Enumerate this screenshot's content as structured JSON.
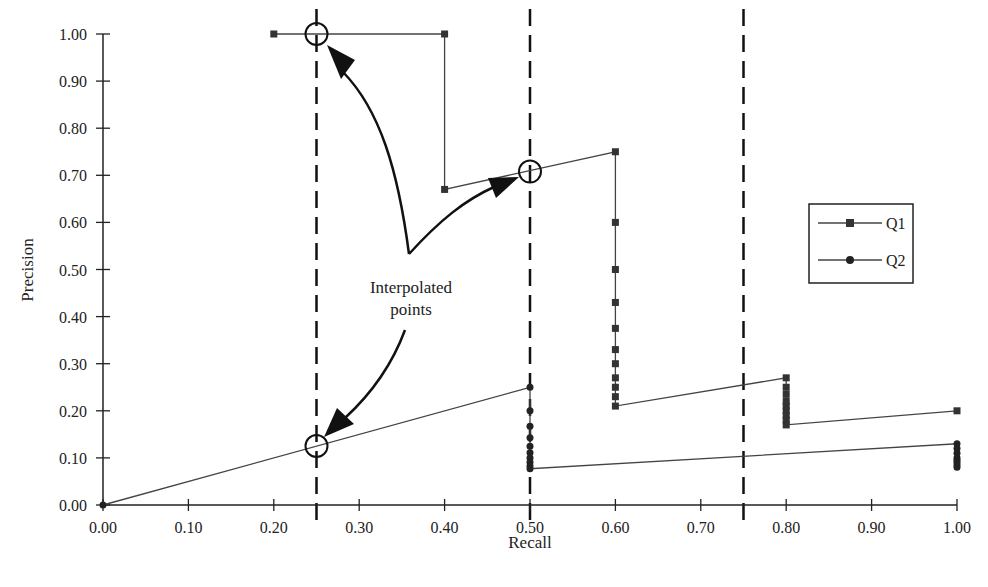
{
  "chart_data": {
    "type": "line",
    "title": "",
    "xlabel": "Recall",
    "ylabel": "Precision",
    "xlim": [
      0,
      1
    ],
    "ylim": [
      0,
      1
    ],
    "grid": false,
    "legend_position": "right",
    "x_ticks": [
      "0.00",
      "0.10",
      "0.20",
      "0.30",
      "0.40",
      "0.50",
      "0.60",
      "0.70",
      "0.80",
      "0.90",
      "1.00"
    ],
    "y_ticks": [
      "0.00",
      "0.10",
      "0.20",
      "0.30",
      "0.40",
      "0.50",
      "0.60",
      "0.70",
      "0.80",
      "0.90",
      "1.00"
    ],
    "series": [
      {
        "name": "Q1",
        "marker": "square",
        "points": [
          [
            0.2,
            1.0
          ],
          [
            0.4,
            1.0
          ],
          [
            0.4,
            0.67
          ],
          [
            0.6,
            0.75
          ],
          [
            0.6,
            0.6
          ],
          [
            0.6,
            0.5
          ],
          [
            0.6,
            0.43
          ],
          [
            0.6,
            0.375
          ],
          [
            0.6,
            0.33
          ],
          [
            0.6,
            0.3
          ],
          [
            0.6,
            0.27
          ],
          [
            0.6,
            0.25
          ],
          [
            0.6,
            0.23
          ],
          [
            0.6,
            0.21
          ],
          [
            0.8,
            0.27
          ],
          [
            0.8,
            0.25
          ],
          [
            0.8,
            0.235
          ],
          [
            0.8,
            0.22
          ],
          [
            0.8,
            0.21
          ],
          [
            0.8,
            0.2
          ],
          [
            0.8,
            0.19
          ],
          [
            0.8,
            0.18
          ],
          [
            0.8,
            0.17
          ],
          [
            1.0,
            0.2
          ]
        ]
      },
      {
        "name": "Q2",
        "marker": "circle",
        "points": [
          [
            0.0,
            0.0
          ],
          [
            0.5,
            0.25
          ],
          [
            0.5,
            0.2
          ],
          [
            0.5,
            0.167
          ],
          [
            0.5,
            0.143
          ],
          [
            0.5,
            0.125
          ],
          [
            0.5,
            0.111
          ],
          [
            0.5,
            0.1
          ],
          [
            0.5,
            0.091
          ],
          [
            0.5,
            0.083
          ],
          [
            0.5,
            0.077
          ],
          [
            1.0,
            0.13
          ],
          [
            1.0,
            0.12
          ],
          [
            1.0,
            0.11
          ],
          [
            1.0,
            0.1
          ],
          [
            1.0,
            0.095
          ],
          [
            1.0,
            0.09
          ],
          [
            1.0,
            0.085
          ],
          [
            1.0,
            0.08
          ]
        ]
      }
    ],
    "reference_lines": [
      {
        "type": "vertical",
        "style": "dashed",
        "x": 0.25
      },
      {
        "type": "vertical",
        "style": "dashed",
        "x": 0.5
      },
      {
        "type": "vertical",
        "style": "dashed",
        "x": 0.75
      }
    ],
    "annotations": [
      {
        "text": "Interpolated points",
        "lines": [
          "Interpolated",
          "points"
        ]
      },
      {
        "type": "circle-marker",
        "x": 0.25,
        "y": 1.0
      },
      {
        "type": "circle-marker",
        "x": 0.5,
        "y": 0.71
      },
      {
        "type": "circle-marker",
        "x": 0.25,
        "y": 0.125
      }
    ]
  },
  "legend": {
    "items": [
      {
        "label": "Q1",
        "marker": "square"
      },
      {
        "label": "Q2",
        "marker": "circle"
      }
    ]
  },
  "annotation": {
    "line1": "Interpolated",
    "line2": "points"
  },
  "axes": {
    "xlabel": "Recall",
    "ylabel": "Precision"
  }
}
